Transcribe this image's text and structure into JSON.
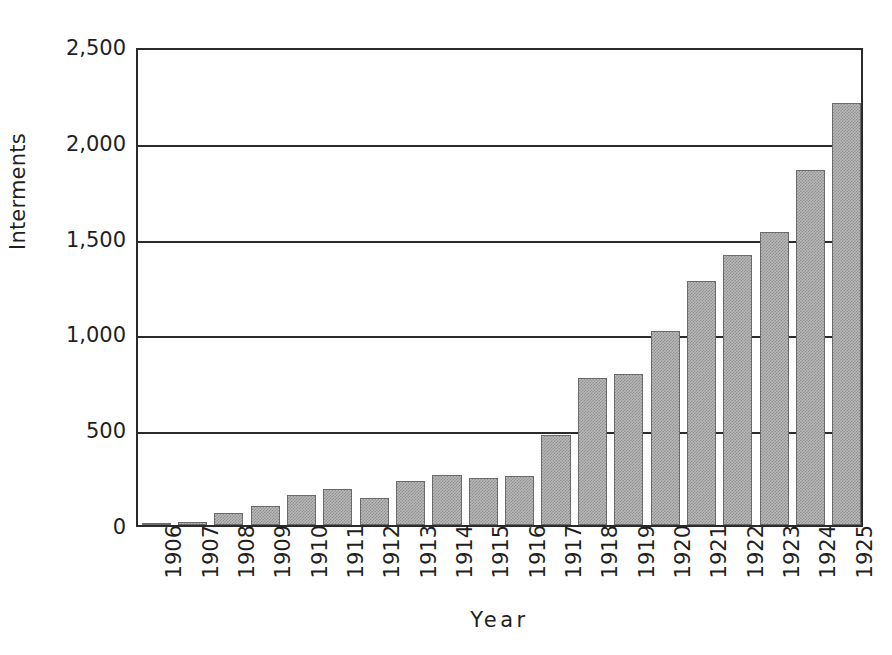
{
  "chart_data": {
    "type": "bar",
    "title": "",
    "xlabel": "Year",
    "ylabel": "Interments",
    "categories": [
      "1906",
      "1907",
      "1908",
      "1909",
      "1910",
      "1911",
      "1912",
      "1913",
      "1914",
      "1915",
      "1916",
      "1917",
      "1918",
      "1919",
      "1920",
      "1921",
      "1922",
      "1923",
      "1924",
      "1925"
    ],
    "values": [
      2,
      18,
      62,
      99,
      156,
      187,
      141,
      229,
      260,
      245,
      255,
      470,
      765,
      786,
      1010,
      1275,
      1410,
      1530,
      1855,
      2205
    ],
    "series": [
      {
        "name": "Interments",
        "values": [
          2,
          18,
          62,
          99,
          156,
          187,
          141,
          229,
          260,
          245,
          255,
          470,
          765,
          786,
          1010,
          1275,
          1410,
          1530,
          1855,
          2205
        ]
      }
    ],
    "ylim": [
      0,
      2500
    ],
    "yticks": [
      0,
      500,
      1000,
      1500,
      2000,
      2500
    ],
    "ytick_labels": [
      "0",
      "500",
      "1,000",
      "1,500",
      "2,000",
      "2,500"
    ],
    "grid": "horizontal",
    "legend": "none",
    "bar_color": "#b9b9b9",
    "bar_edge_color": "#6a6a6a",
    "axis_color": "#2b2b2b",
    "background_color": "#ffffff"
  }
}
